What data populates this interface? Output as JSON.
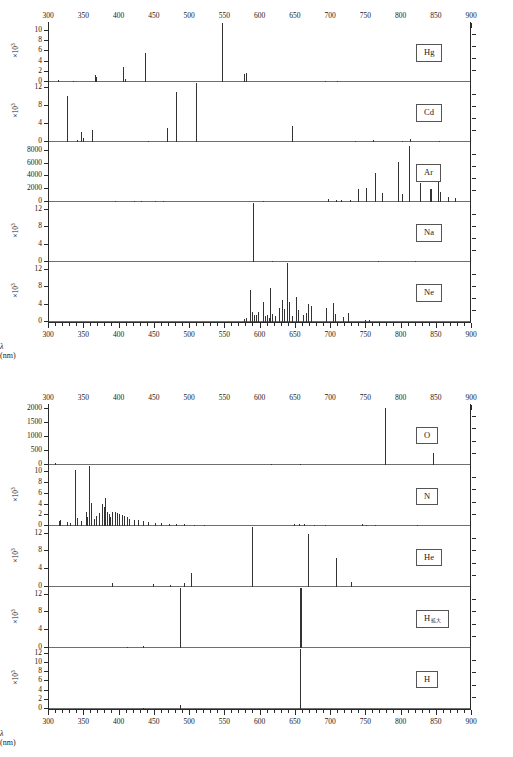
{
  "figures": [
    {
      "id": "top",
      "axis": {
        "xlabel_text": "λ (nm)",
        "xmin": 300,
        "xmax": 900,
        "major_ticks": [
          300,
          350,
          400,
          450,
          500,
          550,
          600,
          650,
          700,
          750,
          800,
          850,
          900
        ],
        "tick_labels": [
          "300",
          "350",
          "400",
          "450",
          "500",
          "550",
          "600",
          "650",
          "700",
          "750",
          "800",
          "850",
          "900"
        ],
        "minor_step": 10
      },
      "panels": [
        {
          "label": "Hg",
          "label_sub": "",
          "ymul": "×10",
          "ymul_exp": "3",
          "ymax": 11.5,
          "yticks": [
            0,
            2,
            4,
            6,
            8,
            10
          ],
          "ytick_labels": [
            "0",
            "2",
            "4",
            "6",
            "8",
            "10"
          ],
          "peaks": [
            {
              "x": 313,
              "y": 0.35
            },
            {
              "x": 334,
              "y": 0.25
            },
            {
              "x": 365,
              "y": 1.4
            },
            {
              "x": 366,
              "y": 1.0
            },
            {
              "x": 405,
              "y": 2.9
            },
            {
              "x": 408,
              "y": 0.6
            },
            {
              "x": 436,
              "y": 5.7
            },
            {
              "x": 546,
              "y": 11.5
            },
            {
              "x": 577,
              "y": 1.6
            },
            {
              "x": 579,
              "y": 1.7
            },
            {
              "x": 691,
              "y": 0.12
            },
            {
              "x": 708,
              "y": 0.1
            }
          ]
        },
        {
          "label": "Cd",
          "label_sub": "",
          "ymul": "×10",
          "ymul_exp": "3",
          "ymax": 13.0,
          "yticks": [
            0,
            4,
            8,
            12
          ],
          "ytick_labels": [
            "0",
            "4",
            "8",
            "12"
          ],
          "peaks": [
            {
              "x": 326,
              "y": 10.2
            },
            {
              "x": 340,
              "y": 0.5
            },
            {
              "x": 346,
              "y": 2.3
            },
            {
              "x": 348,
              "y": 0.9
            },
            {
              "x": 361,
              "y": 2.6
            },
            {
              "x": 441,
              "y": 0.3
            },
            {
              "x": 467,
              "y": 3.2
            },
            {
              "x": 480,
              "y": 11.0
            },
            {
              "x": 509,
              "y": 13.0
            },
            {
              "x": 644,
              "y": 3.5
            },
            {
              "x": 734,
              "y": 0.3
            },
            {
              "x": 760,
              "y": 0.5
            },
            {
              "x": 800,
              "y": 0.3
            },
            {
              "x": 812,
              "y": 0.7
            },
            {
              "x": 853,
              "y": 0.25
            }
          ]
        },
        {
          "label": "Ar",
          "label_sub": "",
          "ymul": "",
          "ymul_exp": "",
          "ymax": 9200,
          "yticks": [
            0,
            2000,
            4000,
            6000,
            8000
          ],
          "ytick_labels": [
            "0",
            "2000",
            "4000",
            "6000",
            "8000"
          ],
          "peaks": [
            {
              "x": 394,
              "y": 180
            },
            {
              "x": 420,
              "y": 240
            },
            {
              "x": 430,
              "y": 200
            },
            {
              "x": 451,
              "y": 170
            },
            {
              "x": 461,
              "y": 160
            },
            {
              "x": 603,
              "y": 130
            },
            {
              "x": 696,
              "y": 420
            },
            {
              "x": 707,
              "y": 330
            },
            {
              "x": 714,
              "y": 300
            },
            {
              "x": 727,
              "y": 260
            },
            {
              "x": 738,
              "y": 2100
            },
            {
              "x": 750,
              "y": 2200
            },
            {
              "x": 763,
              "y": 4500
            },
            {
              "x": 772,
              "y": 1400
            },
            {
              "x": 795,
              "y": 6300
            },
            {
              "x": 801,
              "y": 1200
            },
            {
              "x": 811,
              "y": 8800
            },
            {
              "x": 826,
              "y": 2900
            },
            {
              "x": 840,
              "y": 2100
            },
            {
              "x": 842,
              "y": 2000
            },
            {
              "x": 852,
              "y": 5200
            },
            {
              "x": 855,
              "y": 1600
            },
            {
              "x": 866,
              "y": 800
            },
            {
              "x": 876,
              "y": 600
            }
          ]
        },
        {
          "label": "Na",
          "label_sub": "",
          "ymul": "×10",
          "ymul_exp": "3",
          "ymax": 13.5,
          "yticks": [
            0,
            4,
            8,
            12
          ],
          "ytick_labels": [
            "0",
            "4",
            "8",
            "12"
          ],
          "peaks": [
            {
              "x": 589,
              "y": 13.5
            },
            {
              "x": 590,
              "y": 12.0
            },
            {
              "x": 616,
              "y": 0.18
            },
            {
              "x": 766,
              "y": 0.12
            },
            {
              "x": 819,
              "y": 0.3
            }
          ]
        },
        {
          "label": "Ne",
          "label_sub": "",
          "ymul": "×10",
          "ymul_exp": "3",
          "ymax": 13.5,
          "yticks": [
            0,
            4,
            8,
            12
          ],
          "ytick_labels": [
            "0",
            "4",
            "8",
            "12"
          ],
          "peaks": [
            {
              "x": 576,
              "y": 0.6
            },
            {
              "x": 580,
              "y": 1.0
            },
            {
              "x": 585,
              "y": 7.4
            },
            {
              "x": 588,
              "y": 2.3
            },
            {
              "x": 591,
              "y": 1.5
            },
            {
              "x": 594,
              "y": 1.7
            },
            {
              "x": 597,
              "y": 2.3
            },
            {
              "x": 603,
              "y": 4.5
            },
            {
              "x": 607,
              "y": 1.4
            },
            {
              "x": 609,
              "y": 1.7
            },
            {
              "x": 612,
              "y": 0.9
            },
            {
              "x": 614,
              "y": 7.8
            },
            {
              "x": 617,
              "y": 1.8
            },
            {
              "x": 621,
              "y": 1.3
            },
            {
              "x": 626,
              "y": 3.3
            },
            {
              "x": 630,
              "y": 5.0
            },
            {
              "x": 633,
              "y": 3.0
            },
            {
              "x": 638,
              "y": 13.5
            },
            {
              "x": 640,
              "y": 4.6
            },
            {
              "x": 644,
              "y": 1.3
            },
            {
              "x": 650,
              "y": 5.7
            },
            {
              "x": 653,
              "y": 2.8
            },
            {
              "x": 660,
              "y": 1.5
            },
            {
              "x": 664,
              "y": 2.1
            },
            {
              "x": 667,
              "y": 4.1
            },
            {
              "x": 671,
              "y": 3.6
            },
            {
              "x": 693,
              "y": 3.3
            },
            {
              "x": 703,
              "y": 4.3
            },
            {
              "x": 705,
              "y": 1.8
            },
            {
              "x": 717,
              "y": 1.2
            },
            {
              "x": 724,
              "y": 2.0
            },
            {
              "x": 748,
              "y": 0.4
            },
            {
              "x": 754,
              "y": 0.4
            }
          ]
        }
      ]
    },
    {
      "id": "bottom",
      "axis": {
        "xlabel_text": "λ (nm)",
        "xmin": 300,
        "xmax": 900,
        "major_ticks": [
          300,
          350,
          400,
          450,
          500,
          550,
          600,
          650,
          700,
          750,
          800,
          850,
          900
        ],
        "tick_labels": [
          "300",
          "350",
          "400",
          "450",
          "500",
          "550",
          "600",
          "650",
          "700",
          "750",
          "800",
          "850",
          "900"
        ],
        "minor_step": 10
      },
      "panels": [
        {
          "label": "O",
          "label_sub": "",
          "ymul": "",
          "ymul_exp": "",
          "ymax": 2150,
          "yticks": [
            0,
            500,
            1000,
            1500,
            2000
          ],
          "ytick_labels": [
            "0",
            "500",
            "1000",
            "1500",
            "2000"
          ],
          "peaks": [
            {
              "x": 308,
              "y": 70
            },
            {
              "x": 615,
              "y": 40
            },
            {
              "x": 656,
              "y": 30
            },
            {
              "x": 777,
              "y": 2050
            },
            {
              "x": 845,
              "y": 430
            }
          ]
        },
        {
          "label": "N",
          "label_sub": "",
          "ymul": "×10",
          "ymul_exp": "3",
          "ymax": 11.2,
          "yticks": [
            0,
            2,
            4,
            6,
            8,
            10
          ],
          "ytick_labels": [
            "0",
            "2",
            "4",
            "6",
            "8",
            "10"
          ],
          "peaks": [
            {
              "x": 314,
              "y": 0.9
            },
            {
              "x": 316,
              "y": 1.1
            },
            {
              "x": 326,
              "y": 0.7
            },
            {
              "x": 330,
              "y": 0.6
            },
            {
              "x": 337,
              "y": 10.5
            },
            {
              "x": 340,
              "y": 1.5
            },
            {
              "x": 346,
              "y": 0.9
            },
            {
              "x": 353,
              "y": 2.7
            },
            {
              "x": 354,
              "y": 1.6
            },
            {
              "x": 357,
              "y": 11.2
            },
            {
              "x": 359,
              "y": 4.3
            },
            {
              "x": 364,
              "y": 1.4
            },
            {
              "x": 367,
              "y": 1.9
            },
            {
              "x": 371,
              "y": 2.5
            },
            {
              "x": 375,
              "y": 4.1
            },
            {
              "x": 378,
              "y": 3.6
            },
            {
              "x": 380,
              "y": 5.3
            },
            {
              "x": 382,
              "y": 2.6
            },
            {
              "x": 385,
              "y": 2.2
            },
            {
              "x": 387,
              "y": 1.6
            },
            {
              "x": 389,
              "y": 2.6
            },
            {
              "x": 394,
              "y": 2.7
            },
            {
              "x": 396,
              "y": 2.4
            },
            {
              "x": 399,
              "y": 2.2
            },
            {
              "x": 403,
              "y": 2.0
            },
            {
              "x": 406,
              "y": 1.8
            },
            {
              "x": 410,
              "y": 1.6
            },
            {
              "x": 414,
              "y": 1.4
            },
            {
              "x": 420,
              "y": 1.2
            },
            {
              "x": 426,
              "y": 1.1
            },
            {
              "x": 434,
              "y": 0.9
            },
            {
              "x": 441,
              "y": 0.7
            },
            {
              "x": 450,
              "y": 0.6
            },
            {
              "x": 459,
              "y": 0.5
            },
            {
              "x": 470,
              "y": 0.4
            },
            {
              "x": 480,
              "y": 0.35
            },
            {
              "x": 492,
              "y": 0.3
            },
            {
              "x": 505,
              "y": 0.25
            },
            {
              "x": 520,
              "y": 0.2
            },
            {
              "x": 648,
              "y": 0.3
            },
            {
              "x": 654,
              "y": 0.35
            },
            {
              "x": 662,
              "y": 0.3
            },
            {
              "x": 676,
              "y": 0.25
            },
            {
              "x": 692,
              "y": 0.2
            },
            {
              "x": 744,
              "y": 0.3
            },
            {
              "x": 750,
              "y": 0.25
            },
            {
              "x": 762,
              "y": 0.2
            },
            {
              "x": 822,
              "y": 0.15
            }
          ]
        },
        {
          "label": "He",
          "label_sub": "",
          "ymul": "×10",
          "ymul_exp": "3",
          "ymax": 13.5,
          "yticks": [
            0,
            4,
            8,
            12
          ],
          "ytick_labels": [
            "0",
            "4",
            "8",
            "12"
          ],
          "peaks": [
            {
              "x": 389,
              "y": 1.0
            },
            {
              "x": 447,
              "y": 0.7
            },
            {
              "x": 471,
              "y": 0.4
            },
            {
              "x": 492,
              "y": 0.9
            },
            {
              "x": 502,
              "y": 3.1
            },
            {
              "x": 588,
              "y": 13.5
            },
            {
              "x": 668,
              "y": 12.0
            },
            {
              "x": 707,
              "y": 6.5
            },
            {
              "x": 728,
              "y": 1.1
            }
          ]
        },
        {
          "label": "H",
          "label_sub": "拡大",
          "ymul": "×10",
          "ymul_exp": "3",
          "ymax": 13.5,
          "yticks": [
            0,
            4,
            8,
            12
          ],
          "ytick_labels": [
            "0",
            "4",
            "8",
            "12"
          ],
          "peaks": [
            {
              "x": 410,
              "y": 0.15
            },
            {
              "x": 434,
              "y": 0.45
            },
            {
              "x": 486,
              "y": 13.5
            },
            {
              "x": 656,
              "y": 13.5
            },
            {
              "x": 658,
              "y": 13.5
            }
          ]
        },
        {
          "label": "H",
          "label_sub": "",
          "ymul": "×10",
          "ymul_exp": "3",
          "ymax": 13.0,
          "yticks": [
            0,
            2,
            4,
            6,
            8,
            10,
            12
          ],
          "ytick_labels": [
            "0",
            "2",
            "4",
            "6",
            "8",
            "10",
            "12"
          ],
          "peaks": [
            {
              "x": 434,
              "y": 0.12
            },
            {
              "x": 486,
              "y": 0.9
            },
            {
              "x": 656,
              "y": 13.0
            }
          ]
        }
      ]
    }
  ]
}
